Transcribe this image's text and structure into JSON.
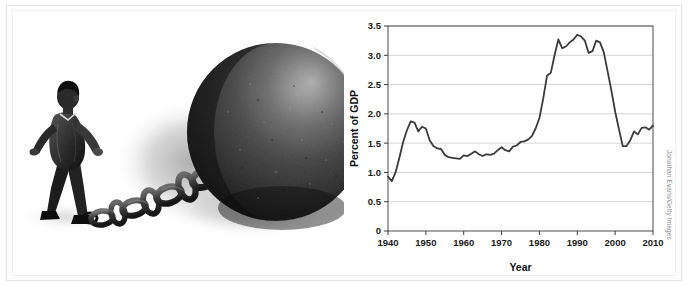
{
  "figure": {
    "credit": "Jonathan Evans/Getty Images",
    "illustration": {
      "alt": "Illustration of a businessman in a suit straining to drag an oversized iron ball and chain shackled to his ankle",
      "subject_names": [
        "businessman-figure",
        "chain",
        "iron-ball",
        "ground-shadow"
      ]
    }
  },
  "chart_data": {
    "type": "line",
    "title": "",
    "xlabel": "Year",
    "ylabel": "Percent of GDP",
    "xlim": [
      1940,
      2010
    ],
    "ylim": [
      0,
      3.5
    ],
    "grid": "horizontal",
    "legend": "none",
    "xticks": [
      1940,
      1950,
      1960,
      1970,
      1980,
      1990,
      2000,
      2010
    ],
    "xtick_labels": [
      "1940",
      "1950",
      "1960",
      "1970",
      "1980",
      "1990",
      "2000",
      "2010"
    ],
    "yticks": [
      0,
      0.5,
      1.0,
      1.5,
      2.0,
      2.5,
      3.0,
      3.5
    ],
    "ytick_labels": [
      "0",
      "0.5",
      "1.0",
      "1.5",
      "2.0",
      "2.5",
      "3.0",
      "3.5"
    ],
    "series": [
      {
        "name": "Net interest outlays as percent of GDP",
        "color": "#3a3a3a",
        "x": [
          1940,
          1941,
          1942,
          1943,
          1944,
          1945,
          1946,
          1947,
          1948,
          1949,
          1950,
          1951,
          1952,
          1953,
          1954,
          1955,
          1956,
          1957,
          1958,
          1959,
          1960,
          1961,
          1962,
          1963,
          1964,
          1965,
          1966,
          1967,
          1968,
          1969,
          1970,
          1971,
          1972,
          1973,
          1974,
          1975,
          1976,
          1977,
          1978,
          1979,
          1980,
          1981,
          1982,
          1983,
          1984,
          1985,
          1986,
          1987,
          1988,
          1989,
          1990,
          1991,
          1992,
          1993,
          1994,
          1995,
          1996,
          1997,
          1998,
          1999,
          2000,
          2001,
          2002,
          2003,
          2004,
          2005,
          2006,
          2007,
          2008,
          2009,
          2010
        ],
        "values": [
          0.93,
          0.85,
          1.0,
          1.25,
          1.52,
          1.72,
          1.87,
          1.85,
          1.7,
          1.78,
          1.75,
          1.55,
          1.45,
          1.41,
          1.4,
          1.3,
          1.26,
          1.25,
          1.24,
          1.23,
          1.29,
          1.28,
          1.32,
          1.36,
          1.31,
          1.28,
          1.31,
          1.3,
          1.32,
          1.38,
          1.43,
          1.38,
          1.36,
          1.44,
          1.46,
          1.52,
          1.53,
          1.56,
          1.62,
          1.75,
          1.93,
          2.26,
          2.65,
          2.7,
          3.0,
          3.27,
          3.12,
          3.15,
          3.22,
          3.27,
          3.35,
          3.32,
          3.25,
          3.04,
          3.07,
          3.25,
          3.22,
          3.05,
          2.73,
          2.4,
          2.04,
          1.74,
          1.45,
          1.45,
          1.55,
          1.7,
          1.65,
          1.76,
          1.77,
          1.73,
          1.8
        ]
      }
    ],
    "annotations": [
      {
        "label": "peak plateau",
        "x_range": [
          1984,
          1997
        ],
        "y_range": [
          3.0,
          3.35
        ]
      },
      {
        "label": "post-2000 trough",
        "x": 2003,
        "y": 1.45
      },
      {
        "label": "WWII peak",
        "x": 1947,
        "y": 1.87
      },
      {
        "label": "start",
        "x": 1940,
        "y": 0.93
      }
    ]
  }
}
